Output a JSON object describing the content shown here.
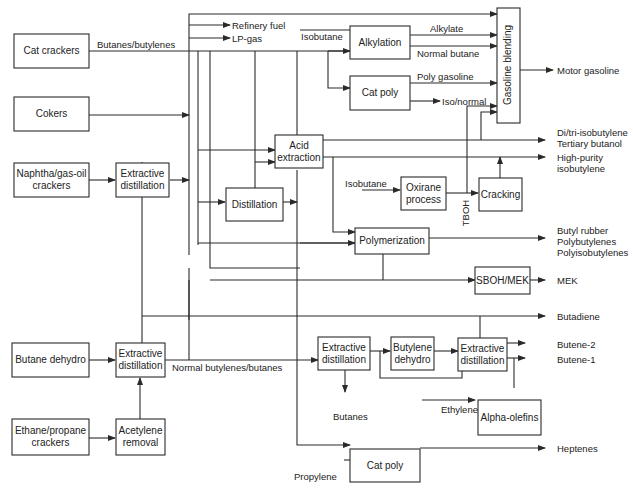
{
  "diagram": {
    "title": "",
    "boxes": {
      "cat_crackers": "Cat crackers",
      "cokers": "Cokers",
      "naphtha": "Naphtha/gas-oil\ncrackers",
      "extractive_dist_1": "Extractive\ndistillation",
      "butane_dehydro": "Butane dehydro",
      "extractive_dist_2": "Extractive\ndistillation",
      "ethane_propane": "Ethane/propane\ncrackers",
      "acetylene_removal": "Acetylene\nremoval",
      "alkylation": "Alkylation",
      "cat_poly_top": "Cat poly",
      "gasoline_blending": "Gasoline blending",
      "acid_extraction": "Acid\nextraction",
      "distillation": "Distillation",
      "oxirane": "Oxirane\nprocess",
      "cracking": "Cracking",
      "polymerization": "Polymerization",
      "sboh_mek": "SBOH/MEK",
      "extractive_dist_3": "Extractive\ndistillation",
      "butylene_dehydro": "Butylene\ndehydro",
      "extractive_dist_4": "Extractive\ndistillation",
      "alpha_olefins": "Alpha-olefins",
      "cat_poly_bottom": "Cat poly"
    },
    "labels": {
      "butanes_butylenes": "Butanes/butylenes",
      "refinery_fuel": "Refinery fuel",
      "lp_gas": "LP-gas",
      "isobutane_top": "Isobutane",
      "alkylate": "Alkylate",
      "normal_butane": "Normal butane",
      "poly_gasoline": "Poly gasoline",
      "iso_normal": "Iso/normal",
      "isobutane_mid": "Isobutane",
      "tboh": "TBOH",
      "normal_butylenes_butanes": "Normal butylenes/butanes",
      "butanes_out": "Butanes",
      "ethylene": "Ethylene",
      "propylene": "Propylene"
    },
    "outputs": {
      "motor_gasoline": "Motor gasoline",
      "di_tri": "Di/tri-isobutylene\nTertiary butanol",
      "high_purity": "High-purity\nisobutylene",
      "butyl_rubber": "Butyl rubber\nPolybutylenes\nPolyisobutylenes",
      "mek": "MEK",
      "butadiene": "Butadiene",
      "butene2": "Butene-2",
      "butene1": "Butene-1",
      "heptenes": "Heptenes"
    }
  }
}
